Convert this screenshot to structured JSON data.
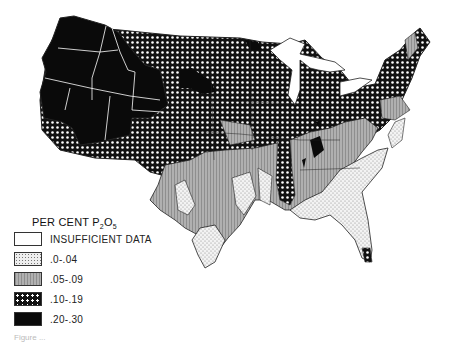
{
  "legend": {
    "title_main": "PER CENT P",
    "title_sub1": "2",
    "title_mid": "O",
    "title_sub2": "5",
    "items": [
      {
        "label": "INSUFFICIENT DATA",
        "pattern": "blank"
      },
      {
        "label": ".0-.04",
        "pattern": "stipple"
      },
      {
        "label": ".05-.09",
        "pattern": "gray-lines"
      },
      {
        "label": ".10-.19",
        "pattern": "checker"
      },
      {
        "label": ".20-.30",
        "pattern": "black"
      }
    ]
  },
  "caption": "Figure ...",
  "colors": {
    "black": "#0a0a0a",
    "gray": "#a8a8a8",
    "stipple_bg": "#eeeeee",
    "outline": "#222222"
  }
}
